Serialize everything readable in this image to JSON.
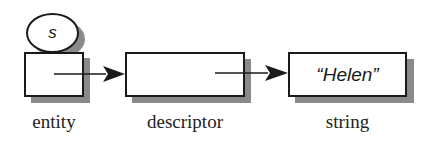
{
  "diagram": {
    "nodes": [
      {
        "id": "entity",
        "label": "entity",
        "content": "",
        "tag": "s"
      },
      {
        "id": "descriptor",
        "label": "descriptor",
        "content": ""
      },
      {
        "id": "string",
        "label": "string",
        "content": "“Helen”"
      }
    ],
    "edges": [
      {
        "from": "entity",
        "to": "descriptor"
      },
      {
        "from": "descriptor",
        "to": "string"
      }
    ],
    "colors": {
      "stroke": "#1a1a1a",
      "shadow": "#8a8a8a",
      "fill": "#ffffff"
    }
  }
}
